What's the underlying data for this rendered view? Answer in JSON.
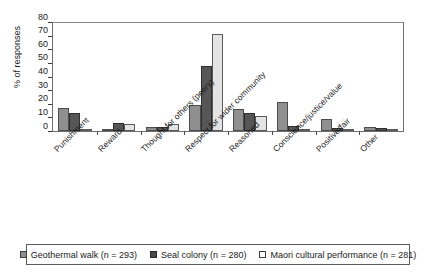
{
  "chart_data": {
    "type": "bar",
    "title": "",
    "xlabel": "",
    "ylabel": "% of responses",
    "ylim": [
      0,
      80
    ],
    "yticks": [
      0,
      10,
      20,
      30,
      40,
      50,
      60,
      70,
      80
    ],
    "grid": false,
    "legend_position": "bottom",
    "categories": [
      "Punishment",
      "Reward",
      "Thought for others (peers)",
      "Respect for wider community",
      "Reasoned",
      "Conscience/justice/value",
      "Positive/fair",
      "Other"
    ],
    "series": [
      {
        "name": "Geothermal walk (n = 293)",
        "color": "#8f8f8f",
        "values": [
          17,
          1,
          3,
          19,
          16,
          21,
          9,
          3
        ]
      },
      {
        "name": "Seal colony (n = 280)",
        "color": "#565656",
        "values": [
          13,
          6,
          3,
          48,
          13,
          4,
          2,
          2
        ]
      },
      {
        "name": "Maori cultural performance (n = 281)",
        "color": "#e4e4e4",
        "values": [
          0.5,
          5,
          5.5,
          71,
          11,
          1,
          0.5,
          0.5
        ]
      }
    ]
  },
  "legend": {
    "items": [
      {
        "label": "Geothermal walk (n = 293)",
        "swatch": "series-0"
      },
      {
        "label": "Seal colony (n = 280)",
        "swatch": "series-1"
      },
      {
        "label": "Maori cultural performance (n = 281)",
        "swatch": "series-2"
      }
    ]
  }
}
